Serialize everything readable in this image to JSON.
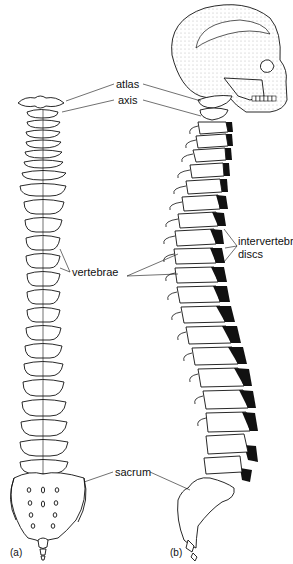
{
  "figure": {
    "panel_a_caption": "(a)",
    "panel_b_caption": "(b)",
    "labels": {
      "atlas": "atlas",
      "axis": "axis",
      "intervertebral_discs_line1": "intervertebral",
      "intervertebral_discs_line2": "discs",
      "vertebrae": "vertebrae",
      "sacrum": "sacrum"
    }
  }
}
